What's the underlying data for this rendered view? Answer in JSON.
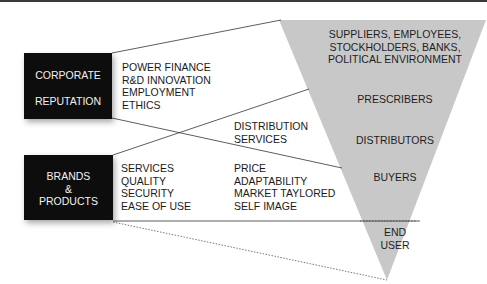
{
  "diagram": {
    "sources": [
      {
        "id": "corporate",
        "label_lines": [
          "CORPORATE",
          "REPUTATION"
        ],
        "attributes": [
          "POWER FINANCE",
          "R&D INNOVATION",
          "EMPLOYMENT",
          "ETHICS"
        ]
      },
      {
        "id": "brands",
        "label_lines": [
          "BRANDS",
          "&",
          "PRODUCTS"
        ],
        "attributes": [
          "SERVICES",
          "QUALITY",
          "SECURITY",
          "EASE OF USE"
        ]
      }
    ],
    "middle_groups": [
      {
        "id": "distribution",
        "lines": [
          "DISTRIBUTION",
          "SERVICES"
        ]
      },
      {
        "id": "market",
        "lines": [
          "PRICE",
          "ADAPTABILITY",
          "MARKET TAYLORED",
          "SELF IMAGE"
        ]
      }
    ],
    "funnel_levels": [
      {
        "id": "stakeholders",
        "lines": [
          "SUPPLIERS, EMPLOYEES,",
          "STOCKHOLDERS, BANKS,",
          "POLITICAL ENVIRONMENT"
        ]
      },
      {
        "id": "prescribers",
        "lines": [
          "PRESCRIBERS"
        ]
      },
      {
        "id": "distributors",
        "lines": [
          "DISTRIBUTORS"
        ]
      },
      {
        "id": "buyers",
        "lines": [
          "BUYERS"
        ]
      },
      {
        "id": "end-user",
        "lines": [
          "END",
          "USER"
        ]
      }
    ],
    "colors": {
      "box": "#0d0d0d",
      "funnel": "#c8c8c8",
      "line": "#333333"
    }
  }
}
